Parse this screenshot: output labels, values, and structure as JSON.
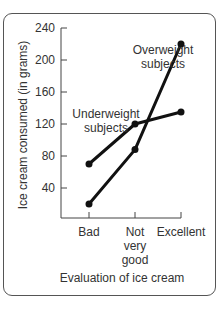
{
  "chart_data": {
    "type": "line",
    "title": "",
    "xlabel": "Evaluation of ice cream",
    "ylabel": "Ice cream consumed (in grams)",
    "categories": [
      "Bad",
      "Not very good",
      "Excellent"
    ],
    "category_label_lines": [
      [
        "Bad"
      ],
      [
        "Not",
        "very",
        "good"
      ],
      [
        "Excellent"
      ]
    ],
    "yticks": [
      40,
      80,
      120,
      160,
      200,
      240
    ],
    "ylim": [
      0,
      240
    ],
    "grid": false,
    "legend_position": "inline annotations",
    "series": [
      {
        "name": "Underweight subjects",
        "values": [
          70,
          120,
          135
        ],
        "annotation_lines": [
          "Underweight",
          "subjects"
        ]
      },
      {
        "name": "Overweight subjects",
        "values": [
          20,
          88,
          220
        ],
        "annotation_lines": [
          "Overweight",
          "subjects"
        ]
      }
    ]
  },
  "colors": {
    "line": "#111111",
    "axis": "#444444",
    "frame": "#555555",
    "text": "#333333"
  }
}
